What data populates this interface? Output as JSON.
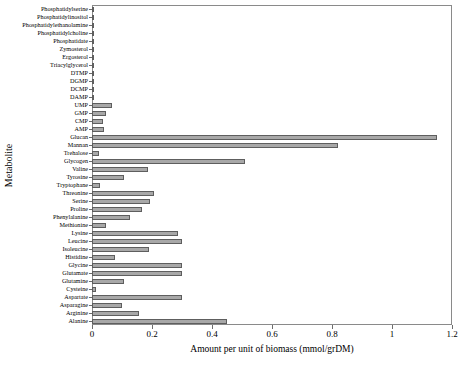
{
  "chart_data": {
    "type": "bar",
    "orientation": "horizontal",
    "title": "",
    "xlabel": "Amount per unit of biomass (mmol/grDM)",
    "ylabel": "Metabolite",
    "xlim": [
      0,
      1.2
    ],
    "xticks": [
      0,
      0.2,
      0.4,
      0.6,
      0.8,
      1,
      1.2
    ],
    "xticklabels": [
      "0",
      "0.2",
      "0.4",
      "0.6",
      "0.8",
      "1",
      "1.2"
    ],
    "grid": false,
    "legend": null,
    "bar_color": "#a8a8a8",
    "bar_edge_color": "#5e5e5e",
    "categories": [
      "Phosphatidylserine",
      "Phosphatidylinositol",
      "Phosphatidylethanolamine",
      "Phosphatidylcholine",
      "Phosphatidate",
      "Zymosterol",
      "Ergosterol",
      "Triacylglycerol",
      "DTMP",
      "DGMP",
      "DCMP",
      "DAMP",
      "UMP",
      "GMP",
      "CMP",
      "AMP",
      "Glucan",
      "Mannan",
      "Trehalose",
      "Glycogen",
      "Valine",
      "Tyrosine",
      "Tryptophane",
      "Threonine",
      "Serine",
      "Proline",
      "Phenylalanine",
      "Methionine",
      "Lysine",
      "Leucine",
      "Isoleucine",
      "Histidine",
      "Glycine",
      "Glutamate",
      "Glutamine",
      "Cysteine",
      "Aspartate",
      "Asparagine",
      "Arginine",
      "Alanine"
    ],
    "values": [
      0.006,
      0.004,
      0.005,
      0.008,
      0.002,
      0.001,
      0.002,
      0.007,
      0.003,
      0.003,
      0.003,
      0.005,
      0.065,
      0.046,
      0.035,
      0.041,
      1.15,
      0.82,
      0.022,
      0.51,
      0.185,
      0.107,
      0.025,
      0.205,
      0.193,
      0.165,
      0.128,
      0.048,
      0.285,
      0.3,
      0.19,
      0.075,
      0.3,
      0.3,
      0.105,
      0.012,
      0.3,
      0.1,
      0.155,
      0.45
    ]
  }
}
